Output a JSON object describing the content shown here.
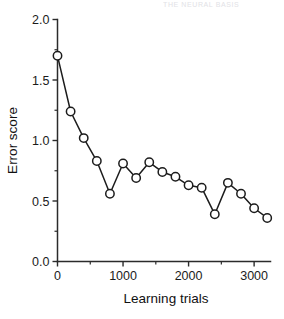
{
  "header": {
    "faded_text": "THE NEURAL BASIS"
  },
  "chart_data": {
    "type": "line",
    "title": "",
    "subtitle": "",
    "xlabel": "Learning trials",
    "ylabel": "Error score",
    "xlim": [
      0,
      3250
    ],
    "ylim": [
      0.0,
      2.0
    ],
    "grid": false,
    "legend": null,
    "x_ticks": [
      0,
      1000,
      2000,
      3000
    ],
    "x_tick_labels": [
      "0",
      "1000",
      "2000",
      "3000"
    ],
    "x_minor_ticks": [
      500,
      1500,
      2500
    ],
    "y_ticks": [
      0.0,
      0.5,
      1.0,
      1.5,
      2.0
    ],
    "y_tick_labels": [
      "0.0",
      "0.5",
      "1.0",
      "1.5",
      "2.0"
    ],
    "y_minor_ticks": [
      0.25,
      0.75,
      1.25,
      1.75
    ],
    "marker": "open-circle",
    "x": [
      0,
      200,
      400,
      600,
      800,
      1000,
      1200,
      1400,
      1600,
      1800,
      2000,
      2200,
      2400,
      2600,
      2800,
      3000,
      3200
    ],
    "values": [
      1.7,
      1.24,
      1.02,
      0.83,
      0.56,
      0.81,
      0.69,
      0.82,
      0.74,
      0.7,
      0.63,
      0.61,
      0.39,
      0.65,
      0.56,
      0.44,
      0.36
    ],
    "series": [
      {
        "name": "Error score",
        "values": [
          1.7,
          1.24,
          1.02,
          0.83,
          0.56,
          0.81,
          0.69,
          0.82,
          0.74,
          0.7,
          0.63,
          0.61,
          0.39,
          0.65,
          0.56,
          0.44,
          0.36
        ]
      }
    ]
  },
  "colors": {
    "line": "#1c1c1c",
    "marker_fill": "#ffffff",
    "axis": "#2b2b2b",
    "text": "#111111",
    "background": "#ffffff"
  }
}
